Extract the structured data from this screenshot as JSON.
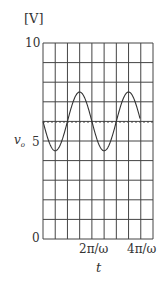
{
  "chart_data": {
    "type": "line",
    "title": "",
    "unit_label": "[V]",
    "ylabel": "v₀",
    "xlabel": "t",
    "ylim": [
      0,
      10
    ],
    "y_ticks": [
      {
        "value": 0,
        "label": "0"
      },
      {
        "value": 5,
        "label": "5"
      },
      {
        "value": 10,
        "label": "10"
      }
    ],
    "x_ticks": [
      {
        "label": "2π/ω"
      },
      {
        "label": "4π/ω"
      }
    ],
    "grid": {
      "columns": 9,
      "rows": 10,
      "visible": true
    },
    "dc_level": 6,
    "series": [
      {
        "name": "v0",
        "description": "sinusoid",
        "offset": 6,
        "amplitude": 1.5,
        "max": 7.5,
        "min": 4.5,
        "period_grid_columns": 4
      }
    ]
  },
  "labels": {
    "unit": "[V]",
    "y10": "10",
    "y5": "5",
    "y0": "0",
    "v0": "v",
    "v0_sub": "o",
    "x1": "2π/ω",
    "x2": "4π/ω",
    "t": "t"
  }
}
